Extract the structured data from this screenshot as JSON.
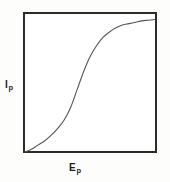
{
  "figure": {
    "background_color": "#fdfdfc",
    "plot_background_color": "#ffffff",
    "frame_color": "#2b2b2b",
    "curve_color": "#555555"
  },
  "axes": {
    "y": {
      "symbol": "I",
      "subscript": "p",
      "full_label": "Ip"
    },
    "x": {
      "symbol": "E",
      "subscript": "p",
      "full_label": "Ep"
    }
  },
  "chart_data": {
    "type": "line",
    "title": "",
    "subtitle": "",
    "xlabel": "Ep",
    "ylabel": "Ip",
    "xlim": [
      0,
      1
    ],
    "ylim": [
      0,
      1
    ],
    "grid": false,
    "legend": null,
    "ticks": {
      "x": [],
      "y": []
    },
    "annotations": [],
    "series": [
      {
        "name": "plate characteristic",
        "shape": "sigmoid",
        "x": [
          0.0,
          0.05,
          0.1,
          0.15,
          0.2,
          0.25,
          0.3,
          0.35,
          0.4,
          0.45,
          0.5,
          0.55,
          0.6,
          0.65,
          0.7,
          0.75,
          0.8,
          0.85,
          0.9,
          0.95,
          1.0
        ],
        "y": [
          0.0,
          0.02,
          0.05,
          0.08,
          0.12,
          0.17,
          0.23,
          0.32,
          0.45,
          0.58,
          0.69,
          0.77,
          0.83,
          0.87,
          0.9,
          0.92,
          0.93,
          0.94,
          0.95,
          0.955,
          0.96
        ]
      }
    ]
  }
}
